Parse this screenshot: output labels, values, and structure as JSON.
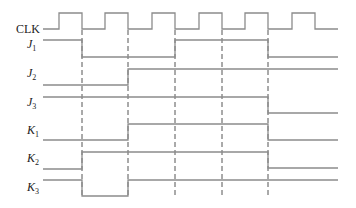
{
  "diagram": {
    "type": "timing-diagram",
    "signals": [
      {
        "id": "clk",
        "label": "CLK",
        "sub": "",
        "label_y": 33,
        "points": [
          [
            43,
            29
          ],
          [
            59,
            29
          ],
          [
            59,
            13
          ],
          [
            82,
            13
          ],
          [
            82,
            29
          ],
          [
            105,
            29
          ],
          [
            105,
            13
          ],
          [
            128,
            13
          ],
          [
            128,
            29
          ],
          [
            152,
            29
          ],
          [
            152,
            13
          ],
          [
            175,
            13
          ],
          [
            175,
            29
          ],
          [
            199,
            29
          ],
          [
            199,
            13
          ],
          [
            222,
            13
          ],
          [
            222,
            29
          ],
          [
            245,
            29
          ],
          [
            245,
            13
          ],
          [
            268,
            13
          ],
          [
            268,
            29
          ],
          [
            292,
            29
          ],
          [
            292,
            13
          ],
          [
            315,
            13
          ],
          [
            315,
            29
          ],
          [
            338,
            29
          ]
        ]
      },
      {
        "id": "j1",
        "label": "J",
        "sub": "1",
        "label_y": 48,
        "points": [
          [
            43,
            40
          ],
          [
            82,
            40
          ],
          [
            82,
            57
          ],
          [
            175,
            57
          ],
          [
            175,
            40
          ],
          [
            268,
            40
          ],
          [
            268,
            57
          ],
          [
            338,
            57
          ]
        ]
      },
      {
        "id": "j2",
        "label": "J",
        "sub": "2",
        "label_y": 77,
        "points": [
          [
            43,
            85
          ],
          [
            128,
            85
          ],
          [
            128,
            69
          ],
          [
            338,
            69
          ]
        ]
      },
      {
        "id": "j3",
        "label": "J",
        "sub": "3",
        "label_y": 106,
        "points": [
          [
            43,
            97
          ],
          [
            268,
            97
          ],
          [
            268,
            113
          ],
          [
            338,
            113
          ]
        ]
      },
      {
        "id": "k1",
        "label": "K",
        "sub": "1",
        "label_y": 134,
        "points": [
          [
            43,
            140
          ],
          [
            128,
            140
          ],
          [
            128,
            124
          ],
          [
            268,
            124
          ],
          [
            268,
            140
          ],
          [
            338,
            140
          ]
        ]
      },
      {
        "id": "k2",
        "label": "K",
        "sub": "2",
        "label_y": 162,
        "points": [
          [
            43,
            169
          ],
          [
            82,
            169
          ],
          [
            82,
            152
          ],
          [
            268,
            152
          ],
          [
            268,
            168
          ],
          [
            338,
            168
          ]
        ]
      },
      {
        "id": "k3",
        "label": "K",
        "sub": "3",
        "label_y": 191,
        "points": [
          [
            43,
            180
          ],
          [
            82,
            180
          ],
          [
            82,
            196
          ],
          [
            128,
            196
          ],
          [
            128,
            180
          ],
          [
            338,
            180
          ]
        ]
      }
    ],
    "clock_edges_x": [
      82,
      128,
      175,
      222,
      268
    ],
    "dash_top": 30,
    "dash_bottom": 196,
    "colors": {
      "wave": "#8c8c8c",
      "dash": "#555555",
      "text": "#222222"
    }
  }
}
